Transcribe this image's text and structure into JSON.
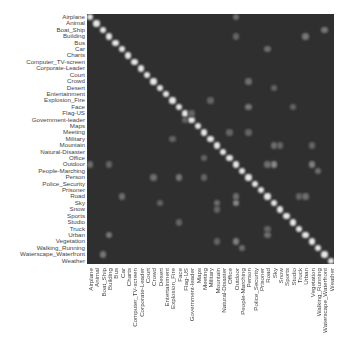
{
  "chart_data": {
    "type": "heatmap",
    "title": "",
    "xlabel": "",
    "ylabel": "",
    "colormap": "grayscale (dark = low, white = high)",
    "background_color": "#2f2f2f",
    "high_color": "#e8e8e8",
    "categories": [
      "Airplane",
      "Animal",
      "Boat_Ship",
      "Building",
      "Bus",
      "Car",
      "Charts",
      "Computer_TV-screen",
      "Corporate-Leader",
      "Court",
      "Crowd",
      "Desert",
      "Entertainment",
      "Explosion_Fire",
      "Face",
      "Flag-US",
      "Government-leader",
      "Maps",
      "Meeting",
      "Military",
      "Mountain",
      "Natural-Disaster",
      "Office",
      "Outdoor",
      "People-Marching",
      "Person",
      "Police_Security",
      "Prisoner",
      "Road",
      "Sky",
      "Snow",
      "Sports",
      "Studio",
      "Truck",
      "Urban",
      "Vegetation",
      "Walking_Running",
      "Waterscape_Waterfront",
      "Weather"
    ],
    "diagonal_value": 1.0,
    "notable_offdiagonal": [
      {
        "row": "Outdoor",
        "col": "Sky",
        "value": 0.5
      },
      {
        "row": "Outdoor",
        "col": "Vegetation",
        "value": 0.45
      },
      {
        "row": "Outdoor",
        "col": "Road",
        "value": 0.35
      },
      {
        "row": "Outdoor",
        "col": "Airplane",
        "value": 0.35
      },
      {
        "row": "Outdoor",
        "col": "Building",
        "value": 0.3
      },
      {
        "row": "Person",
        "col": "Face",
        "value": 0.4
      },
      {
        "row": "Person",
        "col": "Crowd",
        "value": 0.35
      },
      {
        "row": "Person",
        "col": "Meeting",
        "value": 0.3
      },
      {
        "row": "Sky",
        "col": "Mountain",
        "value": 0.35
      },
      {
        "row": "Urban",
        "col": "Building",
        "value": 0.4
      },
      {
        "row": "Urban",
        "col": "Road",
        "value": 0.35
      },
      {
        "row": "Car",
        "col": "Road",
        "value": 0.35
      },
      {
        "row": "Truck",
        "col": "Road",
        "value": 0.3
      },
      {
        "row": "Snow",
        "col": "Mountain",
        "value": 0.3
      },
      {
        "row": "Vegetation",
        "col": "Mountain",
        "value": 0.3
      },
      {
        "row": "Waterscape_Waterfront",
        "col": "Boat_Ship",
        "value": 0.4
      },
      {
        "row": "Walking_Running",
        "col": "People-Marching",
        "value": 0.35
      },
      {
        "row": "Government-leader",
        "col": "Flag-US",
        "value": 0.3
      },
      {
        "row": "Studio",
        "col": "Face",
        "value": 0.3
      },
      {
        "row": "Military",
        "col": "Explosion_Fire",
        "value": 0.3
      },
      {
        "row": "Desert",
        "col": "Sky",
        "value": 0.3
      },
      {
        "row": "Meeting",
        "col": "Office",
        "value": 0.3
      }
    ],
    "value_range": [
      0,
      1
    ],
    "grid": false,
    "legend": "none"
  }
}
